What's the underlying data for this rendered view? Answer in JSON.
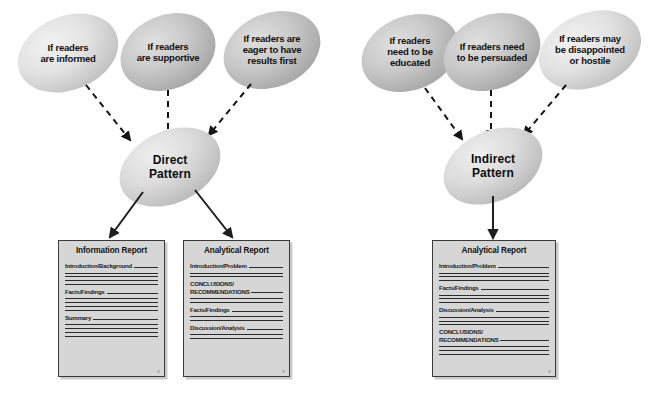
{
  "diagram": {
    "colors": {
      "ellipse_light": "#e8e8e8",
      "ellipse_mid": "#c9c9c9",
      "ellipse_dark": "#a8a8a8",
      "box_fill": "#d6d6d6",
      "box_border": "#3a3a3a",
      "line": "#2b2b2b",
      "text": "#111111"
    },
    "left_group": {
      "conditions": [
        {
          "name": "condition-informed",
          "lines": [
            "If readers",
            "are informed"
          ]
        },
        {
          "name": "condition-supportive",
          "lines": [
            "If readers",
            "are supportive"
          ]
        },
        {
          "name": "condition-eager",
          "lines": [
            "If readers are",
            "eager to have",
            "results first"
          ]
        }
      ],
      "pattern": {
        "name": "direct-pattern",
        "lines": [
          "Direct",
          "Pattern"
        ]
      },
      "reports": [
        {
          "name": "information-report",
          "title": "Information Report",
          "sections": [
            {
              "label": "Introduction/Background",
              "rules": 4
            },
            {
              "label": "Facts/Findings",
              "rules": 4
            },
            {
              "label": "Summary",
              "rules": 4
            }
          ]
        },
        {
          "name": "analytical-report-direct",
          "title": "Analytical Report",
          "sections": [
            {
              "label": "Introduction/Problem",
              "rules": 2
            },
            {
              "label": "CONCLUSIONS/\nRECOMMENDATIONS",
              "rules": 3,
              "two_line": true
            },
            {
              "label": "Facts/Findings",
              "rules": 2
            },
            {
              "label": "Discussion/Analysis",
              "rules": 2
            }
          ]
        }
      ]
    },
    "right_group": {
      "conditions": [
        {
          "name": "condition-educated",
          "lines": [
            "If readers",
            "need to be",
            "educated"
          ]
        },
        {
          "name": "condition-persuaded",
          "lines": [
            "If readers need",
            "to be persuaded"
          ]
        },
        {
          "name": "condition-hostile",
          "lines": [
            "If readers may",
            "be disappointed",
            "or hostile"
          ]
        }
      ],
      "pattern": {
        "name": "indirect-pattern",
        "lines": [
          "Indirect",
          "Pattern"
        ]
      },
      "reports": [
        {
          "name": "analytical-report-indirect",
          "title": "Analytical Report",
          "sections": [
            {
              "label": "Introduction/Problem",
              "rules": 3
            },
            {
              "label": "Facts/Findings",
              "rules": 3
            },
            {
              "label": "Discussion/Analysis",
              "rules": 3
            },
            {
              "label": "CONCLUSIONS/\nRECOMMENDATIONS",
              "rules": 3,
              "two_line": true
            }
          ]
        }
      ]
    }
  }
}
